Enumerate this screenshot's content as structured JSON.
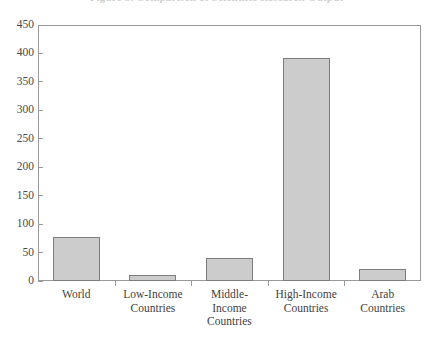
{
  "title_sliver": "Figure 3. Comparison of Scientific Research Output",
  "chart_data": {
    "type": "bar",
    "title": "",
    "xlabel": "",
    "ylabel": "",
    "categories": [
      "World",
      "Low-Income Countries",
      "Middle-Income Countries",
      "High-Income Countries",
      "Arab Countries"
    ],
    "category_lines": [
      [
        "World"
      ],
      [
        "Low-Income",
        "Countries"
      ],
      [
        "Middle-",
        "Income",
        "Countries"
      ],
      [
        "High-Income",
        "Countries"
      ],
      [
        "Arab",
        "Countries"
      ]
    ],
    "values": [
      78,
      10,
      40,
      392,
      21
    ],
    "ylim": [
      0,
      450
    ],
    "ytick_step": 50,
    "yticks": [
      0,
      50,
      100,
      150,
      200,
      250,
      300,
      350,
      400,
      450
    ],
    "ytick_labels": [
      "0",
      "50",
      "100",
      "150",
      "200",
      "250",
      "300",
      "350",
      "400",
      "450"
    ],
    "grid": false,
    "legend": null,
    "bar_fill_color": "#cccccc",
    "bar_border_color": "#7d7d7d",
    "axis_color": "#9a9a9a",
    "text_color": "#3f3f3f"
  }
}
